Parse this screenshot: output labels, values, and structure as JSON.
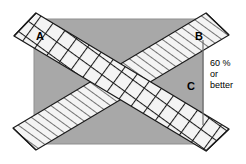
{
  "diagram": {
    "canvas": {
      "width": 246,
      "height": 164,
      "background": "#ffffff"
    },
    "colors": {
      "gray_fill": "#a8a8a8",
      "band_fill": "#f2f2f2",
      "stroke": "#1a1a1a",
      "hatch": "#1a1a1a",
      "text": "#000000"
    },
    "rectangle": {
      "name": "base-rectangle",
      "fill": "#a8a8a8",
      "x": 34,
      "y": 19,
      "width": 169,
      "height": 125
    },
    "bands": [
      {
        "id": "band-a",
        "label": "A",
        "pattern": "cross-hatch",
        "direction": "top-left-to-bottom-right",
        "label_x": 40,
        "label_y": 36
      },
      {
        "id": "band-b",
        "label": "B",
        "pattern": "line-hatch",
        "direction": "bottom-left-to-top-right",
        "label_x": 199,
        "label_y": 36
      }
    ],
    "regions": [
      {
        "id": "region-c",
        "label": "C",
        "label_x": 190,
        "label_y": 86
      }
    ],
    "annotation": {
      "id": "percentage-note",
      "lines": [
        "60 %",
        "or",
        "better"
      ],
      "x": 210,
      "y": 63,
      "line_height": 11
    }
  }
}
